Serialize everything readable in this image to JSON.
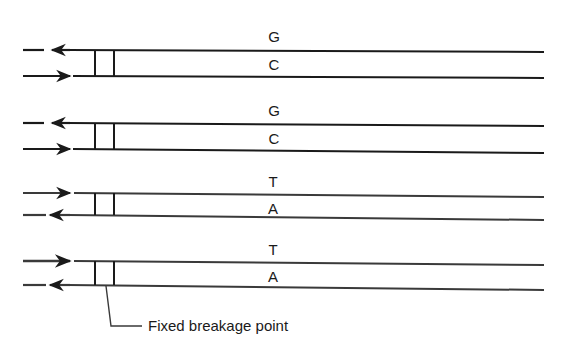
{
  "diagram": {
    "title": "",
    "colors": {
      "stroke": "#1a1a1a",
      "background": "#ffffff"
    },
    "pairs": [
      {
        "top_base": "G",
        "bottom_base": "C",
        "top_arrow": "left",
        "bottom_arrow": "right"
      },
      {
        "top_base": "G",
        "bottom_base": "C",
        "top_arrow": "left",
        "bottom_arrow": "right"
      },
      {
        "top_base": "T",
        "bottom_base": "A",
        "top_arrow": "right",
        "bottom_arrow": "left"
      },
      {
        "top_base": "T",
        "bottom_base": "A",
        "top_arrow": "right",
        "bottom_arrow": "left"
      }
    ],
    "annotation": {
      "label": "Fixed breakage point"
    }
  }
}
